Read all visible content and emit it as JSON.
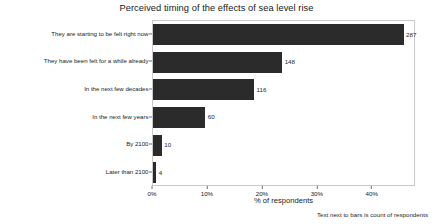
{
  "chart_data": {
    "type": "bar",
    "orientation": "horizontal",
    "title": "Perceived timing of the effects of sea level rise",
    "xlabel": "% of respondents",
    "ylabel": "",
    "note": "Text next to bars is count of respondents",
    "grid": false,
    "legend": null,
    "xlim": [
      0,
      47.5
    ],
    "xticks": [
      0,
      10,
      20,
      30,
      40
    ],
    "xtick_labels": [
      "0%",
      "10%",
      "20%",
      "30%",
      "40%"
    ],
    "categories": [
      "They are starting to be felt right now",
      "They have been felt for a while already",
      "In the next few decades",
      "In the next few years",
      "By 2100",
      "Later than 2100"
    ],
    "values": [
      45.6,
      23.5,
      18.4,
      9.5,
      1.6,
      0.6
    ],
    "counts": [
      287,
      148,
      116,
      60,
      10,
      4
    ],
    "count_labels": [
      "287",
      "148",
      "116",
      "60",
      "10",
      "4"
    ],
    "bar_color": "#2b2b2b",
    "plot_background": "#ffffff",
    "plot_border_color": "#c9c9c9",
    "figure_background": "#ffffff"
  }
}
